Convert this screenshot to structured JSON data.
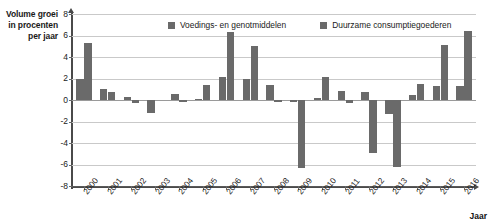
{
  "chart_data": {
    "type": "bar",
    "title": "",
    "subtitle": "",
    "xlabel": "Jaar",
    "ylabel": "Volume groei in procenten per jaar",
    "ylabel_lines": [
      "Volume groei",
      "in procenten",
      "per jaar"
    ],
    "ylim": [
      -8,
      8
    ],
    "ytick_step": 2,
    "yticks": [
      8,
      6,
      4,
      2,
      0,
      -2,
      -4,
      -6,
      -8
    ],
    "ytick_labels": [
      "8",
      "6",
      "4",
      "2",
      "0",
      "-2",
      "-4",
      "-6",
      "-8"
    ],
    "grid": true,
    "grid_axis": "y",
    "legend_position": "top-center",
    "categories": [
      "2000",
      "2001",
      "2002",
      "2003",
      "2004",
      "2005",
      "2006",
      "2007",
      "2008",
      "2009",
      "2010",
      "2011",
      "2012",
      "2013",
      "2014",
      "2015",
      "2016"
    ],
    "series": [
      {
        "name": "Voedings- en genotmiddelen",
        "color": "#6a6a6a",
        "values": [
          2.0,
          1.0,
          0.3,
          -1.2,
          0.6,
          0.1,
          2.1,
          2.0,
          1.4,
          -0.2,
          0.2,
          0.8,
          0.7,
          -1.3,
          0.5,
          1.3,
          1.3
        ]
      },
      {
        "name": "Duurzame consumptiegoederen",
        "color": "#6a6a6a",
        "values": [
          5.3,
          0.7,
          -0.3,
          0.0,
          -0.2,
          1.4,
          6.3,
          5.0,
          -0.2,
          -6.3,
          2.1,
          -0.3,
          -4.9,
          -6.2,
          1.5,
          5.1,
          6.4
        ]
      }
    ]
  },
  "legend": {
    "items": [
      {
        "label": "Voedings- en genotmiddelen"
      },
      {
        "label": "Duurzame consumptiegoederen"
      }
    ]
  },
  "axes": {
    "x_title": "Jaar",
    "y_title_line1": "Volume groei",
    "y_title_line2": "in procenten",
    "y_title_line3": "per jaar"
  }
}
